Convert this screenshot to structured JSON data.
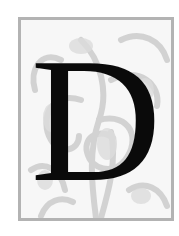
{
  "drop_cap": {
    "letter": "D",
    "frame_color": "#b3b3b3",
    "ornament_color": "#cfcfcf",
    "letter_color": "#0a0a0a",
    "ornament": "foliage-scroll"
  }
}
